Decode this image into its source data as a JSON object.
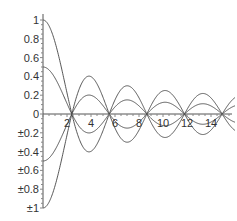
{
  "chart_data": {
    "type": "line",
    "title": "",
    "xlabel": "",
    "ylabel": "",
    "xlim": [
      0,
      16
    ],
    "ylim": [
      -1,
      1
    ],
    "grid": false,
    "legend": null,
    "x_ticks": [
      2,
      4,
      6,
      8,
      10,
      12,
      14
    ],
    "x_tick_labels": [
      "2",
      "4",
      "6",
      "8",
      "10",
      "12",
      "14"
    ],
    "y_ticks": [
      1,
      0.8,
      0.6,
      0.4,
      0.2,
      0,
      -0.2,
      -0.4,
      -0.6,
      -0.8,
      -1
    ],
    "y_tick_labels": [
      "1",
      "0.8",
      "0.6",
      "0.4",
      "0.2",
      "0",
      "±0.2",
      "±0.4",
      "±0.6",
      "±0.8",
      "±1"
    ],
    "series": [
      {
        "name": "J0(x)",
        "scale": 1.0,
        "description": "Bessel J0 envelope, amplitude 1"
      },
      {
        "name": "-J0(x)",
        "scale": -1.0,
        "description": "Negated Bessel J0, amplitude 1"
      },
      {
        "name": "0.5*J0(x)",
        "scale": 0.5,
        "description": "Half-amplitude Bessel J0"
      },
      {
        "name": "-0.5*J0(x)",
        "scale": -0.5,
        "description": "Negated half-amplitude Bessel J0"
      }
    ],
    "zero_crossings": [
      2.405,
      5.52,
      8.654,
      11.79,
      14.93
    ],
    "line_color": "#444444"
  }
}
